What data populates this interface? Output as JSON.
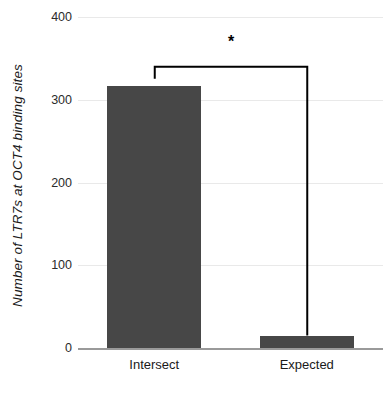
{
  "chart_data": {
    "type": "bar",
    "title": "",
    "xlabel": "",
    "ylabel": "Number of LTR7s at OCT4 binding sites",
    "categories": [
      "Intersect",
      "Expected"
    ],
    "values": [
      317,
      15
    ],
    "ylim": [
      0,
      400
    ],
    "yticks": [
      0,
      100,
      200,
      300,
      400
    ],
    "ytick_labels": [
      "0",
      "100",
      "200",
      "300",
      "400"
    ],
    "grid": true,
    "legend": "none",
    "series": [
      {
        "name": "Number of LTR7s at OCT4 binding sites",
        "values": [
          317,
          15
        ],
        "color": "#474747"
      }
    ],
    "annotations": [
      {
        "type": "significance-bracket",
        "label": "*",
        "from": "Intersect",
        "to": "Expected",
        "level": 340
      }
    ]
  },
  "axes": {
    "y_title": "Number of LTR7s at OCT4 binding sites",
    "y_tick_0": "0",
    "y_tick_1": "100",
    "y_tick_2": "200",
    "y_tick_3": "300",
    "y_tick_4": "400",
    "x_tick_0": "Intersect",
    "x_tick_1": "Expected"
  },
  "annotation": {
    "star": "*"
  },
  "colors": {
    "bar_fill": "#474747",
    "gridline": "#e9e9e9",
    "baseline": "#9a9a9a",
    "bracket": "#000000",
    "background": "#ffffff",
    "text": "#1a1a1a"
  }
}
